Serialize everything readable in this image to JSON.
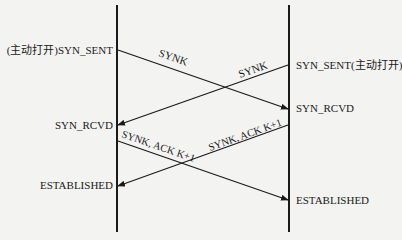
{
  "left_states": {
    "syn_sent": "(主动打开)SYN_SENT",
    "syn_rcvd": "SYN_RCVD",
    "established": "ESTABLISHED"
  },
  "right_states": {
    "syn_sent": "SYN_SENT(主动打开)",
    "syn_rcvd": "SYN_RCVD",
    "established": "ESTABLISHED"
  },
  "messages": {
    "left_to_right_syn": "SYNK",
    "right_to_left_syn": "SYNK",
    "left_to_right_synack": "SYNK, ACK K+1",
    "right_to_left_synack": "SYNK, ACK K+1"
  },
  "colors": {
    "line": "#1a1a1a",
    "background": "#f3f3f1"
  }
}
